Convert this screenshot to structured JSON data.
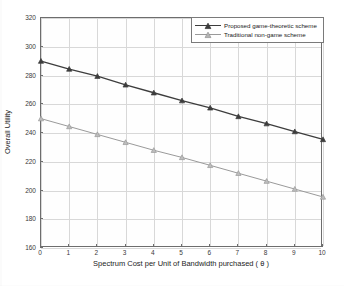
{
  "chart_data": {
    "type": "line",
    "title": "",
    "xlabel": "Spectrum Cost per Unit of Bandwidth purchased ( θ )",
    "ylabel": "Overall Utility",
    "x": [
      0,
      1,
      2,
      3,
      4,
      5,
      6,
      7,
      8,
      9,
      10
    ],
    "xlim": [
      0,
      10
    ],
    "ylim": [
      160,
      320
    ],
    "xticks": [
      "0",
      "1",
      "2",
      "3",
      "4",
      "5",
      "6",
      "7",
      "8",
      "9",
      "10"
    ],
    "yticks": [
      "160",
      "180",
      "200",
      "220",
      "240",
      "260",
      "280",
      "300",
      "320"
    ],
    "grid": true,
    "legend_position": "top-right",
    "series": [
      {
        "name": "Proposed game-theoretic scheme",
        "color": "#3d3d3d",
        "marker": "triangle",
        "values": [
          290,
          284.5,
          279.5,
          273.5,
          268,
          262.5,
          257.5,
          251.5,
          246.5,
          241,
          235.5
        ]
      },
      {
        "name": "Traditional non-game scheme",
        "color": "#9a9a9a",
        "marker": "triangle",
        "values": [
          250,
          244.5,
          239,
          233.5,
          228,
          223,
          217.5,
          212,
          206.5,
          201,
          195.5
        ]
      }
    ]
  },
  "axis": {
    "frame_color": "#6d6d6d",
    "grid_color": "#d8d8d8"
  }
}
